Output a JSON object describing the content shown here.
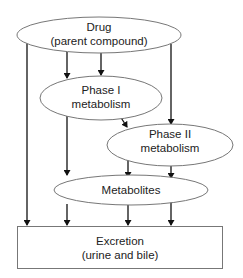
{
  "diagram": {
    "type": "flowchart",
    "nodes": [
      {
        "id": "drug",
        "shape": "ellipse",
        "line1": "Drug",
        "line2": "(parent compound)"
      },
      {
        "id": "phase1",
        "shape": "ellipse",
        "line1": "Phase I",
        "line2": "metabolism"
      },
      {
        "id": "phase2",
        "shape": "ellipse",
        "line1": "Phase II",
        "line2": "metabolism"
      },
      {
        "id": "metabolites",
        "shape": "ellipse",
        "line1": "Metabolites"
      },
      {
        "id": "excretion",
        "shape": "rectangle",
        "line1": "Excretion",
        "line2": "(urine and bile)"
      }
    ],
    "edges": [
      {
        "from": "drug",
        "to": "excretion"
      },
      {
        "from": "drug",
        "to": "phase1"
      },
      {
        "from": "drug",
        "to": "phase1"
      },
      {
        "from": "drug",
        "to": "phase2"
      },
      {
        "from": "phase1",
        "to": "phase2"
      },
      {
        "from": "phase1",
        "to": "metabolites"
      },
      {
        "from": "phase2",
        "to": "metabolites"
      },
      {
        "from": "phase2",
        "to": "metabolites"
      },
      {
        "from": "metabolites",
        "to": "excretion"
      },
      {
        "from": "metabolites",
        "to": "excretion"
      },
      {
        "from": "metabolites",
        "to": "excretion"
      }
    ],
    "colors": {
      "stroke": "#777777",
      "arrow": "#111111",
      "text": "#222222",
      "background": "#ffffff"
    }
  }
}
